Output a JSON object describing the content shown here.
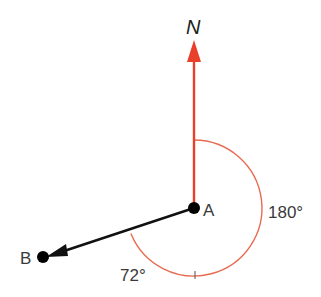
{
  "diagram": {
    "north_label": "N",
    "point_a_label": "A",
    "point_b_label": "B",
    "angle_reflex_label": "180°",
    "angle_small_label": "72°",
    "colors": {
      "north_line": "#e8402a",
      "arc": "#e86a50",
      "bearing_line": "#111111",
      "text": "#3a3a3a"
    }
  }
}
